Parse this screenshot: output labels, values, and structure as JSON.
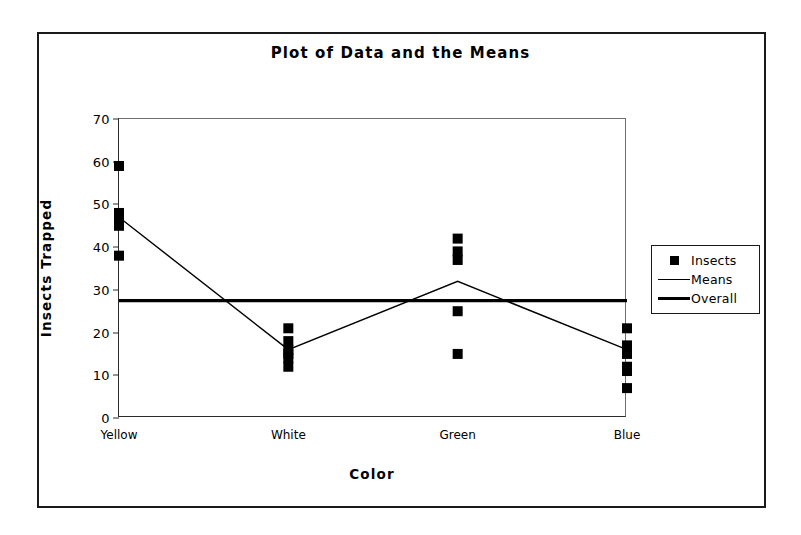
{
  "chart_data": {
    "type": "scatter",
    "title": "Plot of Data and the Means",
    "xlabel": "Color",
    "ylabel": "Insects Trapped",
    "categories": [
      "Yellow",
      "White",
      "Green",
      "Blue"
    ],
    "yticks": [
      0,
      10,
      20,
      30,
      40,
      50,
      60,
      70
    ],
    "ylim": [
      0,
      70
    ],
    "grid": false,
    "legend_position": "right",
    "legend": [
      {
        "label": "Insects",
        "key": "square-marker"
      },
      {
        "label": "Means",
        "key": "thin-line"
      },
      {
        "label": "Overall",
        "key": "thick-line"
      }
    ],
    "series": [
      {
        "name": "Insects",
        "type": "scatter",
        "points": [
          {
            "category": "Yellow",
            "values": [
              59,
              48,
              47,
              46,
              45,
              38
            ]
          },
          {
            "category": "White",
            "values": [
              21,
              18,
              16,
              15,
              14,
              12
            ]
          },
          {
            "category": "Green",
            "values": [
              42,
              39,
              37,
              25,
              15
            ]
          },
          {
            "category": "Blue",
            "values": [
              21,
              17,
              16,
              15,
              12,
              11,
              7
            ]
          }
        ]
      },
      {
        "name": "Means",
        "type": "line",
        "categories": [
          "Yellow",
          "White",
          "Green",
          "Blue"
        ],
        "values": [
          47,
          16,
          32,
          16
        ]
      },
      {
        "name": "Overall",
        "type": "hline",
        "value": 27.5
      }
    ]
  }
}
